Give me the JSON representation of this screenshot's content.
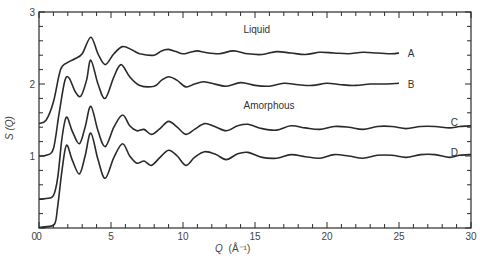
{
  "chart_data": {
    "type": "line",
    "title": "",
    "xlabel": "Q (Å⁻¹)",
    "ylabel": "S (Q)",
    "xlim": [
      0,
      30
    ],
    "ylim": [
      0,
      3
    ],
    "grid": false,
    "x_ticks": [
      0,
      5,
      10,
      15,
      20,
      25,
      30
    ],
    "x_minor_step": 1,
    "y_ticks": [
      1,
      2,
      3
    ],
    "y_tick_labels": [
      "0",
      "1",
      "2",
      "3"
    ],
    "y_minor_step": 0.2,
    "annotations": [
      {
        "text": "Liquid",
        "x": 14.2,
        "y": 2.75
      },
      {
        "text": "Amorphous",
        "x": 14.2,
        "y": 1.7
      }
    ],
    "series": [
      {
        "name": "A",
        "label_pos": [
          25.6,
          2.43
        ],
        "points": [
          [
            0,
            1.45
          ],
          [
            0.5,
            1.5
          ],
          [
            1,
            1.75
          ],
          [
            1.5,
            2.2
          ],
          [
            2,
            2.3
          ],
          [
            2.5,
            2.35
          ],
          [
            3,
            2.42
          ],
          [
            3.6,
            2.65
          ],
          [
            4.1,
            2.42
          ],
          [
            4.6,
            2.27
          ],
          [
            5.2,
            2.42
          ],
          [
            5.8,
            2.52
          ],
          [
            6.5,
            2.47
          ],
          [
            7,
            2.42
          ],
          [
            8,
            2.4
          ],
          [
            8.5,
            2.46
          ],
          [
            9,
            2.48
          ],
          [
            9.5,
            2.45
          ],
          [
            10,
            2.42
          ],
          [
            10.5,
            2.44
          ],
          [
            11,
            2.46
          ],
          [
            11.5,
            2.44
          ],
          [
            12.5,
            2.42
          ],
          [
            13.5,
            2.46
          ],
          [
            14.5,
            2.42
          ],
          [
            15.5,
            2.41
          ],
          [
            16.5,
            2.45
          ],
          [
            17.5,
            2.43
          ],
          [
            18.5,
            2.41
          ],
          [
            19.5,
            2.44
          ],
          [
            20.5,
            2.43
          ],
          [
            21.5,
            2.42
          ],
          [
            22.5,
            2.44
          ],
          [
            23.5,
            2.43
          ],
          [
            24.5,
            2.42
          ],
          [
            25,
            2.43
          ]
        ]
      },
      {
        "name": "B",
        "label_pos": [
          25.6,
          2.0
        ],
        "points": [
          [
            0,
            1.0
          ],
          [
            0.5,
            1.01
          ],
          [
            1,
            1.1
          ],
          [
            1.4,
            1.6
          ],
          [
            1.8,
            2.05
          ],
          [
            2.1,
            2.08
          ],
          [
            2.5,
            1.9
          ],
          [
            2.9,
            1.83
          ],
          [
            3.3,
            2.05
          ],
          [
            3.6,
            2.33
          ],
          [
            4.1,
            2.0
          ],
          [
            4.6,
            1.8
          ],
          [
            5.2,
            2.1
          ],
          [
            5.7,
            2.27
          ],
          [
            6.3,
            2.1
          ],
          [
            7,
            1.98
          ],
          [
            8,
            1.97
          ],
          [
            8.5,
            2.05
          ],
          [
            9,
            2.1
          ],
          [
            9.6,
            2.05
          ],
          [
            10.2,
            1.96
          ],
          [
            10.8,
            2.0
          ],
          [
            11.4,
            2.03
          ],
          [
            12,
            2.01
          ],
          [
            13,
            1.97
          ],
          [
            14,
            2.02
          ],
          [
            15,
            1.98
          ],
          [
            16,
            1.97
          ],
          [
            17,
            2.01
          ],
          [
            18,
            1.99
          ],
          [
            19,
            1.98
          ],
          [
            20,
            2.01
          ],
          [
            21,
            1.99
          ],
          [
            22,
            1.98
          ],
          [
            23,
            2.0
          ],
          [
            24,
            2.0
          ],
          [
            25,
            2.01
          ]
        ]
      },
      {
        "name": "C",
        "label_pos": [
          28.6,
          1.46
        ],
        "points": [
          [
            0,
            0.4
          ],
          [
            0.5,
            0.41
          ],
          [
            1,
            0.45
          ],
          [
            1.3,
            0.7
          ],
          [
            1.6,
            1.25
          ],
          [
            1.9,
            1.54
          ],
          [
            2.3,
            1.35
          ],
          [
            2.8,
            1.17
          ],
          [
            3.2,
            1.4
          ],
          [
            3.6,
            1.69
          ],
          [
            4.1,
            1.35
          ],
          [
            4.6,
            1.13
          ],
          [
            5.2,
            1.4
          ],
          [
            5.8,
            1.57
          ],
          [
            6.3,
            1.42
          ],
          [
            6.8,
            1.35
          ],
          [
            7.3,
            1.37
          ],
          [
            7.8,
            1.3
          ],
          [
            8.4,
            1.38
          ],
          [
            9,
            1.48
          ],
          [
            9.6,
            1.4
          ],
          [
            10.2,
            1.3
          ],
          [
            10.8,
            1.37
          ],
          [
            11.5,
            1.45
          ],
          [
            12.2,
            1.41
          ],
          [
            13,
            1.35
          ],
          [
            13.8,
            1.42
          ],
          [
            14.5,
            1.44
          ],
          [
            15.5,
            1.38
          ],
          [
            16.5,
            1.36
          ],
          [
            17.5,
            1.42
          ],
          [
            18.5,
            1.39
          ],
          [
            19.5,
            1.37
          ],
          [
            20.5,
            1.41
          ],
          [
            21.5,
            1.4
          ],
          [
            22.5,
            1.37
          ],
          [
            23.5,
            1.41
          ],
          [
            24.5,
            1.41
          ],
          [
            25.5,
            1.38
          ],
          [
            26.5,
            1.41
          ],
          [
            27.5,
            1.41
          ],
          [
            28.5,
            1.39
          ],
          [
            29.2,
            1.41
          ],
          [
            30,
            1.42
          ]
        ]
      },
      {
        "name": "D",
        "label_pos": [
          28.6,
          1.05
        ],
        "points": [
          [
            0,
            0.01
          ],
          [
            0.6,
            0.02
          ],
          [
            1.1,
            0.06
          ],
          [
            1.3,
            0.3
          ],
          [
            1.6,
            0.8
          ],
          [
            1.9,
            1.15
          ],
          [
            2.3,
            0.95
          ],
          [
            2.8,
            0.75
          ],
          [
            3.2,
            1.0
          ],
          [
            3.6,
            1.32
          ],
          [
            4.1,
            0.95
          ],
          [
            4.6,
            0.69
          ],
          [
            5.2,
            0.98
          ],
          [
            5.8,
            1.17
          ],
          [
            6.3,
            1.0
          ],
          [
            6.8,
            0.9
          ],
          [
            7.3,
            0.93
          ],
          [
            7.8,
            0.87
          ],
          [
            8.4,
            0.98
          ],
          [
            9,
            1.08
          ],
          [
            9.6,
            1.0
          ],
          [
            10.2,
            0.87
          ],
          [
            10.8,
            0.98
          ],
          [
            11.5,
            1.06
          ],
          [
            12.3,
            1.02
          ],
          [
            13,
            0.95
          ],
          [
            13.8,
            1.03
          ],
          [
            14.5,
            1.05
          ],
          [
            15.5,
            0.98
          ],
          [
            16.5,
            0.97
          ],
          [
            17.5,
            1.02
          ],
          [
            18.5,
            0.99
          ],
          [
            19.5,
            0.97
          ],
          [
            20.5,
            1.02
          ],
          [
            21.5,
            1.0
          ],
          [
            22.5,
            0.97
          ],
          [
            23.5,
            1.01
          ],
          [
            24.5,
            1.01
          ],
          [
            25.5,
            0.98
          ],
          [
            26.5,
            1.02
          ],
          [
            27.5,
            1.02
          ],
          [
            28.5,
            0.98
          ],
          [
            29.2,
            1.01
          ],
          [
            30,
            1.02
          ]
        ]
      }
    ]
  },
  "text": {
    "x_axis_title_q": "Q",
    "x_axis_title_unit": "(Å⁻¹)",
    "y_axis_title": "S (Q)",
    "annotation_liquid": "Liquid",
    "annotation_amorphous": "Amorphous",
    "label_a": "A",
    "label_b": "B",
    "label_c": "C",
    "label_d": "D"
  }
}
